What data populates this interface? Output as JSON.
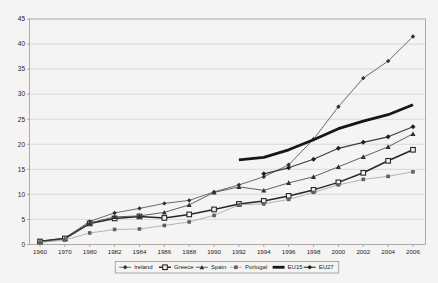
{
  "figure": {
    "background": "#f5f4f2",
    "plot_border_color": "#999999",
    "gridline_color": "#c7c7c7",
    "text_color": "#1c1c1c"
  },
  "chart_data": {
    "type": "line",
    "title": "",
    "xlabel": "",
    "ylabel": "",
    "ylim": [
      0,
      45
    ],
    "yticks": [
      0,
      5,
      10,
      15,
      20,
      25,
      30,
      35,
      40,
      45
    ],
    "grid": "horizontal",
    "legend_position": "bottom",
    "categories": [
      "1960",
      "1970",
      "1980",
      "1982",
      "1984",
      "1986",
      "1988",
      "1990",
      "1992",
      "1994",
      "1996",
      "1998",
      "2000",
      "2002",
      "2004",
      "2006"
    ],
    "series": [
      {
        "name": "Ireland",
        "marker": "diamond",
        "marker_size": 2.2,
        "color": "#5a5a5a",
        "marker_color": "#2f2f2f",
        "line_width": 0.9,
        "values": [
          0.7,
          1.3,
          4.6,
          6.3,
          7.2,
          8.2,
          8.8,
          10.5,
          11.9,
          13.5,
          15.9,
          21.0,
          27.5,
          33.2,
          36.6,
          41.5
        ]
      },
      {
        "name": "Greece",
        "marker": "square-open",
        "marker_size": 2.3,
        "color": "#262626",
        "marker_color": "#262626",
        "line_width": 1.5,
        "values": [
          0.6,
          1.2,
          4.2,
          5.2,
          5.6,
          5.3,
          6.0,
          7.0,
          8.1,
          8.7,
          9.7,
          10.9,
          12.4,
          14.3,
          16.7,
          18.9
        ]
      },
      {
        "name": "Spain",
        "marker": "triangle",
        "marker_size": 2.5,
        "color": "#4f4f4f",
        "marker_color": "#2f2f2f",
        "line_width": 0.9,
        "values": [
          0.5,
          1.1,
          4.3,
          5.5,
          5.7,
          6.4,
          7.9,
          10.4,
          11.5,
          10.8,
          12.3,
          13.5,
          15.5,
          17.5,
          19.5,
          22.1
        ]
      },
      {
        "name": "Portugal",
        "marker": "square",
        "marker_size": 1.8,
        "color": "#ababab",
        "marker_color": "#5f5f5f",
        "line_width": 0.9,
        "values": [
          0.4,
          0.9,
          2.3,
          3.0,
          3.1,
          3.8,
          4.5,
          5.8,
          7.9,
          8.1,
          9.0,
          10.4,
          11.9,
          13.0,
          13.6,
          14.5
        ]
      },
      {
        "name": "EU15",
        "marker": "none",
        "marker_size": 0,
        "color": "#161616",
        "marker_color": "#161616",
        "line_width": 2.8,
        "values": [
          null,
          null,
          null,
          null,
          null,
          null,
          null,
          null,
          16.9,
          17.4,
          18.9,
          20.9,
          23.1,
          24.6,
          25.9,
          27.9
        ]
      },
      {
        "name": "EU27",
        "marker": "diamond",
        "marker_size": 2.5,
        "color": "#3c3c3c",
        "marker_color": "#1f1f1f",
        "line_width": 1.2,
        "values": [
          null,
          null,
          null,
          null,
          null,
          null,
          null,
          null,
          null,
          14.1,
          15.3,
          17.0,
          19.2,
          20.4,
          21.5,
          23.5
        ]
      }
    ]
  }
}
